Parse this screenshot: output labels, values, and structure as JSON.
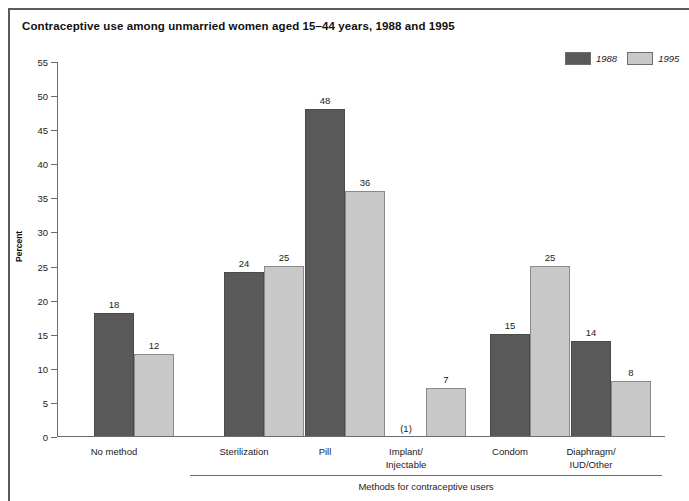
{
  "figure": {
    "title": "Contraceptive use among unmarried women aged 15–44 years, 1988 and 1995"
  },
  "legend": {
    "entries": [
      {
        "label": "1988",
        "color": "#595959"
      },
      {
        "label": "1995",
        "color": "#c8c8c8"
      }
    ]
  },
  "axes": {
    "y_title": "Percent",
    "y_ticks": [
      "0",
      "5",
      "10",
      "15",
      "20",
      "25",
      "30",
      "35",
      "40",
      "45",
      "50",
      "55"
    ],
    "group_bracket_caption": "Methods for contraceptive users"
  },
  "chart_data": {
    "type": "bar",
    "title": "Contraceptive use among unmarried women aged 15–44 years, 1988 and 1995",
    "xlabel": "Methods for contraceptive users",
    "ylabel": "Percent",
    "ylim": [
      0,
      55
    ],
    "ytick_step": 5,
    "grid": false,
    "legend_position": "top-right",
    "categories": [
      "No method",
      "Sterilization",
      "Pill",
      "Implant/\nInjectable",
      "Condom",
      "Diaphragm/\nIUD/Other"
    ],
    "series": [
      {
        "name": "1988",
        "color": "#595959",
        "values": [
          18,
          24,
          48,
          null,
          15,
          14
        ],
        "labels": [
          "18",
          "24",
          "48",
          "(1)",
          "15",
          "14"
        ]
      },
      {
        "name": "1995",
        "color": "#c8c8c8",
        "values": [
          12,
          25,
          36,
          7,
          25,
          8
        ],
        "labels": [
          "12",
          "25",
          "36",
          "7",
          "25",
          "8"
        ]
      }
    ],
    "footnote_markers": {
      "implant_injectable_1988": "(1)"
    }
  },
  "layout": {
    "groups": [
      {
        "key": "no-method",
        "left": 37,
        "label_left": 9,
        "label_width": 96
      },
      {
        "key": "sterilization",
        "left": 167,
        "label_left": 139,
        "label_width": 96
      },
      {
        "key": "pill",
        "left": 248,
        "label_left": 220,
        "label_width": 96
      },
      {
        "key": "implant-injectable",
        "left": 329,
        "label_left": 301,
        "label_width": 96
      },
      {
        "key": "condom",
        "left": 433,
        "label_left": 405,
        "label_width": 96
      },
      {
        "key": "diaphragm-iud-other",
        "left": 514,
        "label_left": 486,
        "label_width": 96
      }
    ],
    "bar_width": 40,
    "plot_height": 375,
    "y_max": 55
  }
}
